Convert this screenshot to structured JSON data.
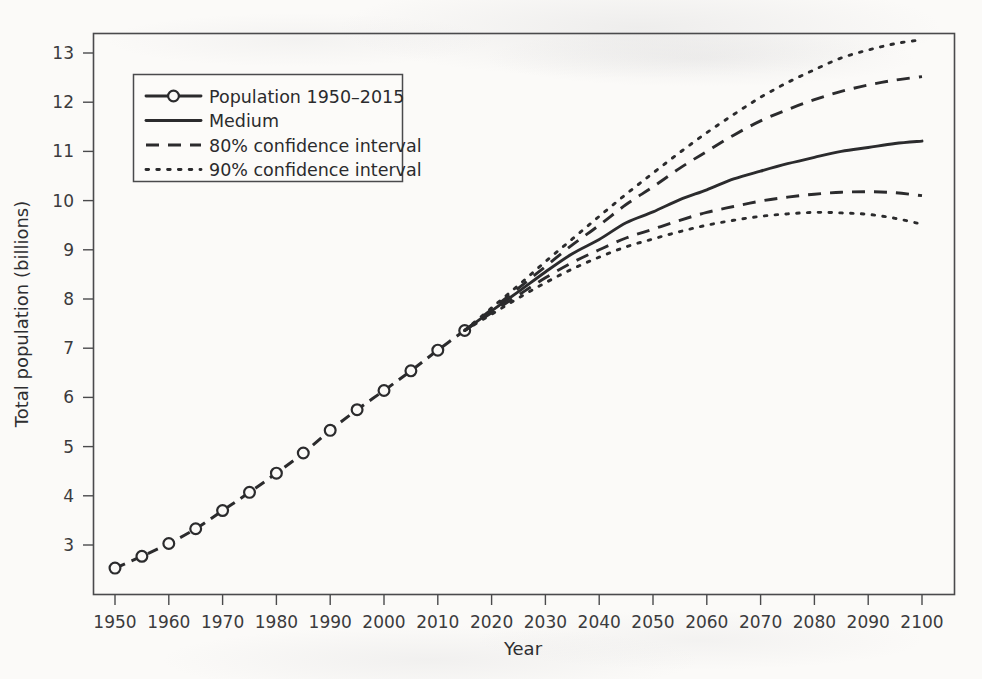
{
  "figure": {
    "background_color": "#fbfaf8",
    "ink_color": "#2b2b2d"
  },
  "axis": {
    "x_title": "Year",
    "y_title": "Total population (billions)",
    "x_ticks": [
      "1950",
      "1960",
      "1970",
      "1980",
      "1990",
      "2000",
      "2010",
      "2020",
      "2030",
      "2040",
      "2050",
      "2060",
      "2070",
      "2080",
      "2090",
      "2100"
    ],
    "y_ticks": [
      "3",
      "4",
      "5",
      "6",
      "7",
      "8",
      "9",
      "10",
      "11",
      "12",
      "13"
    ]
  },
  "legend": {
    "items": [
      {
        "label": "Population 1950–2015",
        "style": "solid-with-marker"
      },
      {
        "label": "Medium",
        "style": "solid"
      },
      {
        "label": "80% confidence interval",
        "style": "dashed"
      },
      {
        "label": "90% confidence interval",
        "style": "dotted"
      }
    ]
  },
  "chart_data": {
    "type": "line",
    "title": "",
    "xlabel": "Year",
    "ylabel": "Total population (billions)",
    "xlim": [
      1950,
      2100
    ],
    "ylim": [
      2.2,
      13.5
    ],
    "grid": false,
    "legend_position": "top-left",
    "x_ticks": [
      1950,
      1960,
      1970,
      1980,
      1990,
      2000,
      2010,
      2020,
      2030,
      2040,
      2050,
      2060,
      2070,
      2080,
      2090,
      2100
    ],
    "y_ticks": [
      3,
      4,
      5,
      6,
      7,
      8,
      9,
      10,
      11,
      12,
      13
    ],
    "series": [
      {
        "name": "Population 1950–2015",
        "style": "solid-with-marker",
        "marker": "open-circle",
        "x": [
          1950,
          1955,
          1960,
          1965,
          1970,
          1975,
          1980,
          1985,
          1990,
          1995,
          2000,
          2005,
          2010,
          2015
        ],
        "values": [
          2.53,
          2.77,
          3.03,
          3.33,
          3.7,
          4.07,
          4.46,
          4.87,
          5.33,
          5.75,
          6.14,
          6.54,
          6.96,
          7.36
        ]
      },
      {
        "name": "Medium",
        "style": "solid",
        "x": [
          2015,
          2020,
          2025,
          2030,
          2035,
          2040,
          2045,
          2050,
          2055,
          2060,
          2065,
          2070,
          2075,
          2080,
          2085,
          2090,
          2095,
          2100
        ],
        "values": [
          7.36,
          7.76,
          8.15,
          8.55,
          8.92,
          9.21,
          9.55,
          9.77,
          10.02,
          10.22,
          10.44,
          10.6,
          10.75,
          10.88,
          11.0,
          11.08,
          11.16,
          11.21
        ]
      },
      {
        "name": "80% confidence interval upper",
        "style": "dashed",
        "x": [
          2015,
          2020,
          2025,
          2030,
          2035,
          2040,
          2045,
          2050,
          2055,
          2060,
          2065,
          2070,
          2075,
          2080,
          2085,
          2090,
          2095,
          2100
        ],
        "values": [
          7.36,
          7.79,
          8.22,
          8.66,
          9.1,
          9.5,
          9.92,
          10.28,
          10.66,
          11.0,
          11.33,
          11.62,
          11.85,
          12.05,
          12.22,
          12.35,
          12.45,
          12.52
        ]
      },
      {
        "name": "80% confidence interval lower",
        "style": "dashed",
        "x": [
          2015,
          2020,
          2025,
          2030,
          2035,
          2040,
          2045,
          2050,
          2055,
          2060,
          2065,
          2070,
          2075,
          2080,
          2085,
          2090,
          2095,
          2100
        ],
        "values": [
          7.36,
          7.72,
          8.08,
          8.43,
          8.74,
          9.0,
          9.24,
          9.42,
          9.6,
          9.76,
          9.88,
          9.99,
          10.07,
          10.13,
          10.17,
          10.18,
          10.16,
          10.1
        ]
      },
      {
        "name": "90% confidence interval upper",
        "style": "dotted",
        "x": [
          2015,
          2020,
          2025,
          2030,
          2035,
          2040,
          2045,
          2050,
          2055,
          2060,
          2065,
          2070,
          2075,
          2080,
          2085,
          2090,
          2095,
          2100
        ],
        "values": [
          7.36,
          7.82,
          8.28,
          8.76,
          9.22,
          9.68,
          10.13,
          10.56,
          10.98,
          11.38,
          11.75,
          12.1,
          12.4,
          12.66,
          12.9,
          13.06,
          13.19,
          13.27
        ]
      },
      {
        "name": "90% confidence interval lower",
        "style": "dotted",
        "x": [
          2015,
          2020,
          2025,
          2030,
          2035,
          2040,
          2045,
          2050,
          2055,
          2060,
          2065,
          2070,
          2075,
          2080,
          2085,
          2090,
          2095,
          2100
        ],
        "values": [
          7.36,
          7.69,
          8.02,
          8.33,
          8.61,
          8.85,
          9.06,
          9.22,
          9.37,
          9.5,
          9.6,
          9.68,
          9.73,
          9.76,
          9.75,
          9.72,
          9.64,
          9.52
        ]
      }
    ]
  }
}
